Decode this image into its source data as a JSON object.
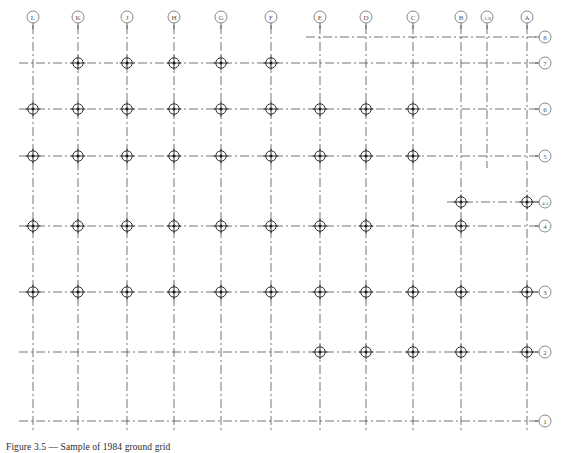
{
  "drawing": {
    "title": "Structural Column Grid Plan",
    "caption": "Figure 3.5 — Sample of 1984 ground grid",
    "line_color": "#3a3a3a",
    "node_color": "#1a1a1a",
    "bubble_color": "#555555",
    "paper_color": "#ffffff",
    "grid_line_style": "dash-dot centerline",
    "node_symbol": "circled-crosshair-dot"
  },
  "geometry": {
    "width": 563,
    "height": 450,
    "bubble_radius": 6.0,
    "node_outer_radius": 5.2,
    "node_cross_arm": 7.4,
    "node_dot_radius": 1.5,
    "lw_grid": 0.7,
    "lw_node": 0.9
  },
  "columns": [
    {
      "label": "L",
      "x": 33
    },
    {
      "label": "K",
      "x": 78
    },
    {
      "label": "J",
      "x": 127
    },
    {
      "label": "H",
      "x": 174
    },
    {
      "label": "G",
      "x": 221
    },
    {
      "label": "F",
      "x": 271
    },
    {
      "label": "E",
      "x": 320
    },
    {
      "label": "D",
      "x": 366
    },
    {
      "label": "C",
      "x": 413
    },
    {
      "label": "B",
      "x": 461
    },
    {
      "label": "A.8",
      "x": 487
    },
    {
      "label": "A",
      "x": 527
    }
  ],
  "rows": [
    {
      "label": "8",
      "y": 37
    },
    {
      "label": "7",
      "y": 63
    },
    {
      "label": "6",
      "y": 109
    },
    {
      "label": "5",
      "y": 156
    },
    {
      "label": "4.3",
      "y": 202
    },
    {
      "label": "4",
      "y": 226
    },
    {
      "label": "3",
      "y": 292
    },
    {
      "label": "2",
      "y": 352
    },
    {
      "label": "1",
      "y": 421
    }
  ],
  "row_extents": [
    {
      "row": "8",
      "from": "E",
      "to": "A"
    },
    {
      "row": "7",
      "from": "L",
      "to": "A"
    },
    {
      "row": "6",
      "from": "L",
      "to": "A"
    },
    {
      "row": "5",
      "from": "L",
      "to": "A"
    },
    {
      "row": "4.3",
      "from": "B",
      "to": "A"
    },
    {
      "row": "4",
      "from": "L",
      "to": "A"
    },
    {
      "row": "3",
      "from": "L",
      "to": "A"
    },
    {
      "row": "2",
      "from": "L",
      "to": "A"
    },
    {
      "row": "1",
      "from": "L",
      "to": "A"
    }
  ],
  "column_extents": [
    {
      "column": "L",
      "from": "8",
      "to": "1"
    },
    {
      "column": "K",
      "from": "8",
      "to": "1"
    },
    {
      "column": "J",
      "from": "8",
      "to": "1"
    },
    {
      "column": "H",
      "from": "8",
      "to": "1"
    },
    {
      "column": "G",
      "from": "8",
      "to": "1"
    },
    {
      "column": "F",
      "from": "8",
      "to": "1"
    },
    {
      "column": "E",
      "from": "8",
      "to": "1"
    },
    {
      "column": "D",
      "from": "8",
      "to": "1"
    },
    {
      "column": "C",
      "from": "8",
      "to": "1"
    },
    {
      "column": "B",
      "from": "8",
      "to": "1"
    },
    {
      "column": "A.8",
      "from": "8",
      "to": "5"
    },
    {
      "column": "A",
      "from": "8",
      "to": "1"
    }
  ],
  "nodes": [
    {
      "row": "7",
      "columns": [
        "K",
        "J",
        "H",
        "G",
        "F"
      ]
    },
    {
      "row": "6",
      "columns": [
        "L",
        "K",
        "J",
        "H",
        "G",
        "F",
        "E",
        "D",
        "C"
      ]
    },
    {
      "row": "5",
      "columns": [
        "L",
        "K",
        "J",
        "H",
        "G",
        "F",
        "E",
        "D",
        "C"
      ]
    },
    {
      "row": "4.3",
      "columns": [
        "B",
        "A"
      ]
    },
    {
      "row": "4",
      "columns": [
        "L",
        "K",
        "J",
        "H",
        "G",
        "F",
        "E",
        "D",
        "B"
      ]
    },
    {
      "row": "3",
      "columns": [
        "L",
        "K",
        "J",
        "H",
        "G",
        "F",
        "E",
        "D",
        "C",
        "B",
        "A"
      ]
    },
    {
      "row": "2",
      "columns": [
        "E",
        "D",
        "C",
        "B",
        "A"
      ]
    }
  ]
}
